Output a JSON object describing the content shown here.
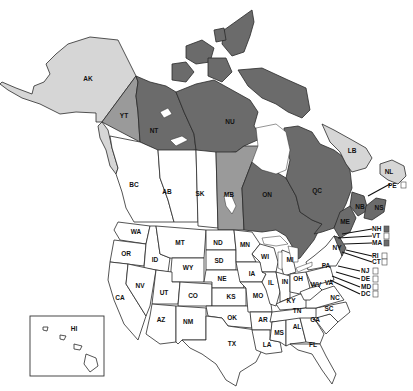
{
  "map": {
    "type": "choropleth",
    "region": "North America (Canada provinces/territories and United States)",
    "shading_colors": {
      "dark": "#6b6b6b",
      "medium": "#9a9a9a",
      "light": "#d6d6d6",
      "none": "#ffffff",
      "outline": "#2a2a2a"
    },
    "canada": {
      "YT": {
        "label": "YT",
        "shade": "medium"
      },
      "NT": {
        "label": "NT",
        "shade": "dark"
      },
      "NU": {
        "label": "NU",
        "shade": "dark"
      },
      "BC": {
        "label": "BC",
        "shade": "none"
      },
      "AB": {
        "label": "AB",
        "shade": "none"
      },
      "SK": {
        "label": "SK",
        "shade": "none"
      },
      "MB": {
        "label": "MB",
        "shade": "medium"
      },
      "ON": {
        "label": "ON",
        "shade": "dark"
      },
      "QC": {
        "label": "QC",
        "shade": "dark"
      },
      "LB": {
        "label": "LB",
        "shade": "light"
      },
      "NL": {
        "label": "NL",
        "shade": "light"
      },
      "NB": {
        "label": "NB",
        "shade": "dark"
      },
      "NS": {
        "label": "NS",
        "shade": "dark"
      },
      "PE": {
        "label": "PE",
        "shade": "none"
      }
    },
    "us": {
      "AK": {
        "label": "AK",
        "shade": "light"
      },
      "HI": {
        "label": "HI",
        "shade": "none"
      },
      "WA": {
        "label": "WA"
      },
      "OR": {
        "label": "OR"
      },
      "CA": {
        "label": "CA"
      },
      "ID": {
        "label": "ID"
      },
      "NV": {
        "label": "NV"
      },
      "MT": {
        "label": "MT"
      },
      "WY": {
        "label": "WY"
      },
      "UT": {
        "label": "UT"
      },
      "AZ": {
        "label": "AZ"
      },
      "CO": {
        "label": "CO"
      },
      "NM": {
        "label": "NM"
      },
      "ND": {
        "label": "ND"
      },
      "SD": {
        "label": "SD"
      },
      "NE": {
        "label": "NE"
      },
      "KS": {
        "label": "KS"
      },
      "OK": {
        "label": "OK"
      },
      "TX": {
        "label": "TX"
      },
      "MN": {
        "label": "MN"
      },
      "IA": {
        "label": "IA"
      },
      "MO": {
        "label": "MO"
      },
      "AR": {
        "label": "AR"
      },
      "LA": {
        "label": "LA"
      },
      "WI": {
        "label": "WI"
      },
      "IL": {
        "label": "IL"
      },
      "MI": {
        "label": "MI"
      },
      "IN": {
        "label": "IN"
      },
      "OH": {
        "label": "OH"
      },
      "KY": {
        "label": "KY"
      },
      "TN": {
        "label": "TN"
      },
      "MS": {
        "label": "MS"
      },
      "AL": {
        "label": "AL"
      },
      "GA": {
        "label": "GA"
      },
      "FL": {
        "label": "FL"
      },
      "SC": {
        "label": "SC"
      },
      "NC": {
        "label": "NC"
      },
      "VA": {
        "label": "VA"
      },
      "WV": {
        "label": "WV"
      },
      "PA": {
        "label": "PA"
      },
      "NY": {
        "label": "NY"
      },
      "ME": {
        "label": "ME",
        "shade": "dark"
      }
    },
    "northeast_callouts": [
      {
        "label": "NH",
        "shade": "dark"
      },
      {
        "label": "VT",
        "shade": "none"
      },
      {
        "label": "MA",
        "shade": "dark"
      },
      {
        "label": "RI",
        "shade": "none"
      },
      {
        "label": "CT",
        "shade": "none"
      },
      {
        "label": "NJ",
        "shade": "none"
      },
      {
        "label": "DE",
        "shade": "none"
      },
      {
        "label": "MD",
        "shade": "none"
      },
      {
        "label": "DC",
        "shade": "none"
      }
    ],
    "pe_callout": {
      "label": "PE",
      "shade": "none"
    }
  }
}
